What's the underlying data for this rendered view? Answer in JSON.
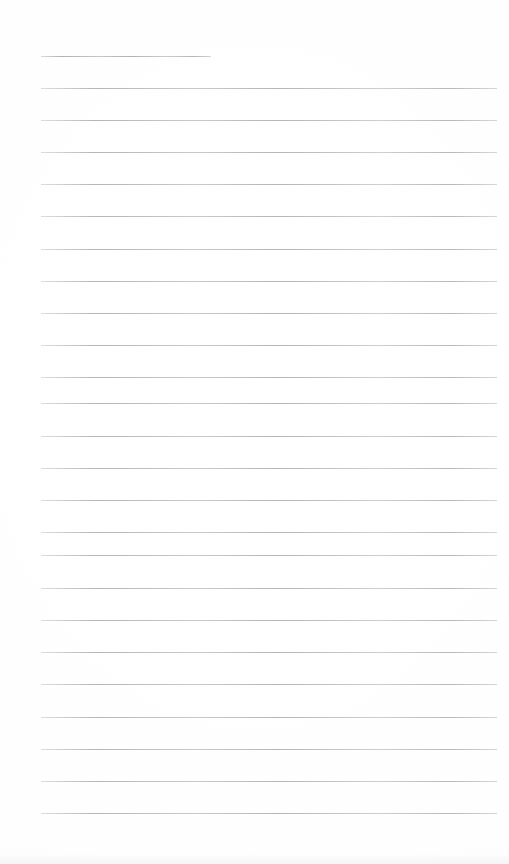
{
  "document": {
    "kind": "lined-paper-page",
    "title": "",
    "body_text": "",
    "page_width": 509,
    "page_height": 864,
    "background_color": "#fefefe",
    "rule_color": "#a9a9ad"
  },
  "ruled_lines": {
    "count": 24,
    "left_margin": 41,
    "right_margin": 497,
    "thickness": 1,
    "spacing": 32.2,
    "first_line_is_short": true,
    "lines": [
      {
        "index": 1,
        "y": 56,
        "x_start": 41,
        "x_end": 211,
        "short": true
      },
      {
        "index": 2,
        "y": 88,
        "x_start": 41,
        "x_end": 497,
        "short": false
      },
      {
        "index": 3,
        "y": 120,
        "x_start": 41,
        "x_end": 497,
        "short": false
      },
      {
        "index": 4,
        "y": 152,
        "x_start": 41,
        "x_end": 497,
        "short": false
      },
      {
        "index": 5,
        "y": 184,
        "x_start": 41,
        "x_end": 497,
        "short": false
      },
      {
        "index": 6,
        "y": 216,
        "x_start": 41,
        "x_end": 497,
        "short": false
      },
      {
        "index": 7,
        "y": 249,
        "x_start": 41,
        "x_end": 497,
        "short": false
      },
      {
        "index": 8,
        "y": 281,
        "x_start": 41,
        "x_end": 497,
        "short": false
      },
      {
        "index": 9,
        "y": 313,
        "x_start": 41,
        "x_end": 497,
        "short": false
      },
      {
        "index": 10,
        "y": 345,
        "x_start": 41,
        "x_end": 497,
        "short": false
      },
      {
        "index": 11,
        "y": 377,
        "x_start": 41,
        "x_end": 497,
        "short": false
      },
      {
        "index": 12,
        "y": 403,
        "x_start": 41,
        "x_end": 497,
        "short": false
      },
      {
        "index": 13,
        "y": 436,
        "x_start": 41,
        "x_end": 497,
        "short": false
      },
      {
        "index": 14,
        "y": 468,
        "x_start": 41,
        "x_end": 497,
        "short": false
      },
      {
        "index": 15,
        "y": 500,
        "x_start": 41,
        "x_end": 497,
        "short": false
      },
      {
        "index": 16,
        "y": 532,
        "x_start": 41,
        "x_end": 497,
        "short": false
      },
      {
        "index": 17,
        "y": 555,
        "x_start": 41,
        "x_end": 497,
        "short": false
      },
      {
        "index": 18,
        "y": 588,
        "x_start": 41,
        "x_end": 497,
        "short": false
      },
      {
        "index": 19,
        "y": 620,
        "x_start": 41,
        "x_end": 497,
        "short": false
      },
      {
        "index": 20,
        "y": 652,
        "x_start": 41,
        "x_end": 497,
        "short": false
      },
      {
        "index": 21,
        "y": 684,
        "x_start": 41,
        "x_end": 497,
        "short": false
      },
      {
        "index": 22,
        "y": 717,
        "x_start": 41,
        "x_end": 497,
        "short": false
      },
      {
        "index": 23,
        "y": 749,
        "x_start": 41,
        "x_end": 497,
        "short": false
      },
      {
        "index": 24,
        "y": 781,
        "x_start": 41,
        "x_end": 497,
        "short": false
      },
      {
        "index": 25,
        "y": 813,
        "x_start": 41,
        "x_end": 497,
        "short": false
      }
    ]
  }
}
